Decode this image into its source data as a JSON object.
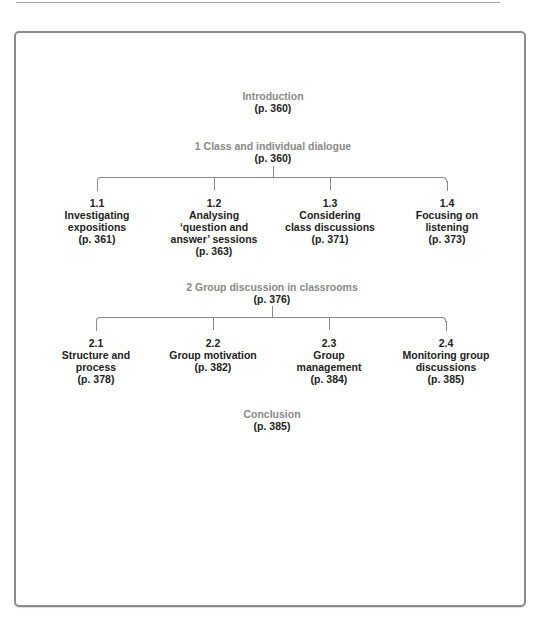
{
  "diagram": {
    "introduction": {
      "title": "Introduction",
      "ref": "(p. 360)"
    },
    "sections": [
      {
        "title": "1  Class and individual dialogue",
        "ref": "(p. 360)",
        "children": [
          {
            "num": "1.1",
            "lines": [
              "Investigating",
              "expositions"
            ],
            "ref": "(p. 361)"
          },
          {
            "num": "1.2",
            "lines": [
              "Analysing",
              "‘question and",
              "answer’ sessions"
            ],
            "ref": "(p. 363)"
          },
          {
            "num": "1.3",
            "lines": [
              "Considering",
              "class discussions"
            ],
            "ref": "(p. 371)"
          },
          {
            "num": "1.4",
            "lines": [
              "Focusing on",
              "listening"
            ],
            "ref": "(p. 373)"
          }
        ]
      },
      {
        "title": "2 Group discussion in classrooms",
        "ref": "(p. 376)",
        "children": [
          {
            "num": "2.1",
            "lines": [
              "Structure and",
              "process"
            ],
            "ref": "(p. 378)"
          },
          {
            "num": "2.2",
            "lines": [
              "Group motivation"
            ],
            "ref": "(p. 382)"
          },
          {
            "num": "2.3",
            "lines": [
              "Group",
              "management"
            ],
            "ref": "(p. 384)"
          },
          {
            "num": "2.4",
            "lines": [
              "Monitoring group",
              "discussions"
            ],
            "ref": "(p. 385)"
          }
        ]
      }
    ],
    "conclusion": {
      "title": "Conclusion",
      "ref": "(p. 385)"
    }
  },
  "colors": {
    "heading_gray": "#8a8a8a",
    "text_dark": "#222222",
    "frame_border": "#8c8c8c"
  }
}
